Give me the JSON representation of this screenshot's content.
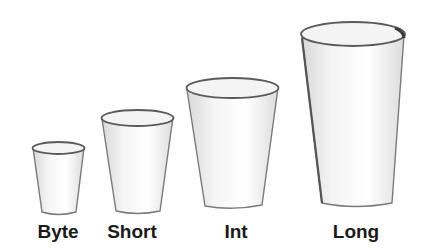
{
  "diagram": {
    "cups": [
      {
        "label": "Byte",
        "size": 1
      },
      {
        "label": "Short",
        "size": 2
      },
      {
        "label": "Int",
        "size": 3
      },
      {
        "label": "Long",
        "size": 4
      }
    ]
  },
  "colors": {
    "background": "#ffffff",
    "outline": "#5a5a5a",
    "shade": "#d6d6d6",
    "label": "#1a1a1a"
  }
}
